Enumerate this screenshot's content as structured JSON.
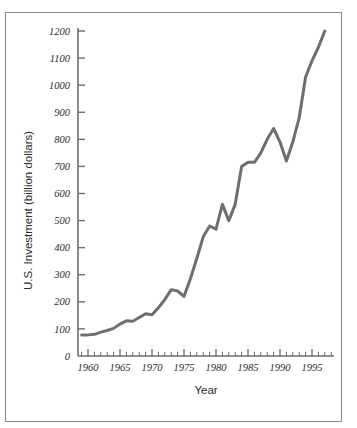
{
  "figure": {
    "border_color": "#8a8a8a",
    "background": "#ffffff"
  },
  "chart_data": {
    "type": "line",
    "title": "",
    "subtitle": "",
    "xlabel": "Year",
    "ylabel": "U.S. Investment (billion dollars)",
    "xlim": [
      1958.5,
      1998.0
    ],
    "ylim": [
      0,
      1250
    ],
    "grid": false,
    "legend": null,
    "line_color": "#6e6e6e",
    "line_width": 3,
    "axis_color": "#6e6e6e",
    "x_major_ticks": [
      1960,
      1965,
      1970,
      1975,
      1980,
      1985,
      1990,
      1995
    ],
    "x_major_tick_labels": [
      "1960",
      "1965",
      "1970",
      "1975",
      "1980",
      "1985",
      "1990",
      "1995"
    ],
    "x_minor_tick_step": 1,
    "y_ticks": [
      0,
      100,
      200,
      300,
      400,
      500,
      600,
      700,
      800,
      900,
      1000,
      1100,
      1200
    ],
    "y_tick_labels": [
      "0",
      "100",
      "200",
      "300",
      "400",
      "500",
      "600",
      "700",
      "800",
      "900",
      "1000",
      "1100",
      "1200"
    ],
    "x": [
      1959,
      1960,
      1961,
      1962,
      1963,
      1964,
      1965,
      1966,
      1967,
      1968,
      1969,
      1970,
      1971,
      1972,
      1973,
      1974,
      1975,
      1976,
      1977,
      1978,
      1979,
      1980,
      1981,
      1982,
      1983,
      1984,
      1985,
      1986,
      1987,
      1988,
      1989,
      1990,
      1991,
      1992,
      1993,
      1994,
      1995,
      1996,
      1997
    ],
    "y": [
      78,
      78,
      80,
      88,
      94,
      102,
      118,
      130,
      128,
      142,
      156,
      152,
      178,
      208,
      245,
      240,
      220,
      285,
      360,
      440,
      480,
      468,
      560,
      500,
      560,
      700,
      715,
      715,
      750,
      800,
      840,
      790,
      720,
      790,
      880,
      1030,
      1090,
      1140,
      1200
    ],
    "series": [
      {
        "name": "U.S. Investment",
        "values": [
          78,
          78,
          80,
          88,
          94,
          102,
          118,
          130,
          128,
          142,
          156,
          152,
          178,
          208,
          245,
          240,
          220,
          285,
          360,
          440,
          480,
          468,
          560,
          500,
          560,
          700,
          715,
          715,
          750,
          800,
          840,
          790,
          720,
          790,
          880,
          1030,
          1090,
          1140,
          1200
        ]
      }
    ]
  }
}
